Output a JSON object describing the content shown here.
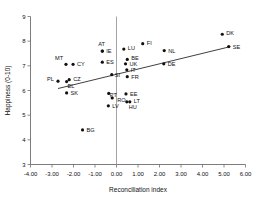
{
  "chart_data": {
    "type": "scatter",
    "title": "",
    "xlabel": "Reconciliation index",
    "ylabel": "Happiness (0-10)",
    "xlim": [
      -4.0,
      6.0
    ],
    "ylim": [
      3,
      9
    ],
    "xticks": [
      -4.0,
      -3.0,
      -2.0,
      -1.0,
      0.0,
      1.0,
      2.0,
      3.0,
      4.0,
      5.0,
      6.0
    ],
    "xtick_labels": [
      "-4.00",
      "-3.00",
      "-2.00",
      "-1.00",
      "0.00",
      "1.00",
      "2.00",
      "3.00",
      "4.00",
      "5.00",
      "6.00"
    ],
    "yticks": [
      3,
      4,
      5,
      6,
      7,
      8,
      9
    ],
    "ytick_labels": [
      "3",
      "4",
      "5",
      "6",
      "7",
      "8",
      "9"
    ],
    "grid": false,
    "legend": "none",
    "zero_reference_line_x": 0.0,
    "marker_color": "#111111",
    "trend_line": {
      "x_start": -2.72,
      "y_start": 6.08,
      "x_end": 5.3,
      "y_end": 7.78,
      "color": "#2a2a2a"
    },
    "points": [
      {
        "label": "MT",
        "x": -2.35,
        "y": 7.06,
        "label_dx": -11,
        "label_dy": -4
      },
      {
        "label": "CY",
        "x": -2.02,
        "y": 7.06,
        "label_dx": 4,
        "label_dy": 2
      },
      {
        "label": "PL",
        "x": -2.72,
        "y": 6.38,
        "label_dx": -11,
        "label_dy": 0
      },
      {
        "label": "EL",
        "x": -2.32,
        "y": 6.36,
        "label_dx": 1,
        "label_dy": 6
      },
      {
        "label": "CZ",
        "x": -2.2,
        "y": 6.44,
        "label_dx": 4,
        "label_dy": 1
      },
      {
        "label": "SK",
        "x": -2.32,
        "y": 5.9,
        "label_dx": 4,
        "label_dy": 2
      },
      {
        "label": "BG",
        "x": -1.58,
        "y": 4.4,
        "label_dx": 4,
        "label_dy": 2
      },
      {
        "label": "AT",
        "x": -0.66,
        "y": 7.6,
        "label_dx": -4,
        "label_dy": -5
      },
      {
        "label": "IE",
        "x": -0.66,
        "y": 7.6,
        "label_dx": 4,
        "label_dy": 2
      },
      {
        "label": "ES",
        "x": -0.66,
        "y": 7.15,
        "label_dx": 4,
        "label_dy": 2
      },
      {
        "label": "PT",
        "x": -0.36,
        "y": 5.88,
        "label_dx": 1,
        "label_dy": 4
      },
      {
        "label": "RO",
        "x": -0.2,
        "y": 5.7,
        "label_dx": 5,
        "label_dy": 4
      },
      {
        "label": "LV",
        "x": -0.38,
        "y": 5.38,
        "label_dx": 4,
        "label_dy": 2
      },
      {
        "label": "SI",
        "x": -0.22,
        "y": 6.64,
        "label_dx": 3,
        "label_dy": 2
      },
      {
        "label": "LU",
        "x": 0.34,
        "y": 7.68,
        "label_dx": 4,
        "label_dy": 1
      },
      {
        "label": "BE",
        "x": 0.5,
        "y": 7.26,
        "label_dx": 4,
        "label_dy": 1
      },
      {
        "label": "UK",
        "x": 0.42,
        "y": 7.08,
        "label_dx": 4,
        "label_dy": 2
      },
      {
        "label": "IT",
        "x": 0.48,
        "y": 6.84,
        "label_dx": 4,
        "label_dy": 2
      },
      {
        "label": "FR",
        "x": 0.5,
        "y": 6.56,
        "label_dx": 4,
        "label_dy": 2
      },
      {
        "label": "EE",
        "x": 0.44,
        "y": 5.86,
        "label_dx": 4,
        "label_dy": 2
      },
      {
        "label": "LT",
        "x": 0.62,
        "y": 5.54,
        "label_dx": 4,
        "label_dy": 1
      },
      {
        "label": "HU",
        "x": 0.48,
        "y": 5.54,
        "label_dx": 2,
        "label_dy": 7
      },
      {
        "label": "FI",
        "x": 1.22,
        "y": 7.9,
        "label_dx": 4,
        "label_dy": 1
      },
      {
        "label": "NL",
        "x": 2.22,
        "y": 7.62,
        "label_dx": 4,
        "label_dy": 2
      },
      {
        "label": "DE",
        "x": 2.2,
        "y": 7.08,
        "label_dx": 4,
        "label_dy": 2
      },
      {
        "label": "DK",
        "x": 4.92,
        "y": 8.28,
        "label_dx": 4,
        "label_dy": 1
      },
      {
        "label": "SE",
        "x": 5.22,
        "y": 7.78,
        "label_dx": 4,
        "label_dy": 2
      }
    ]
  }
}
